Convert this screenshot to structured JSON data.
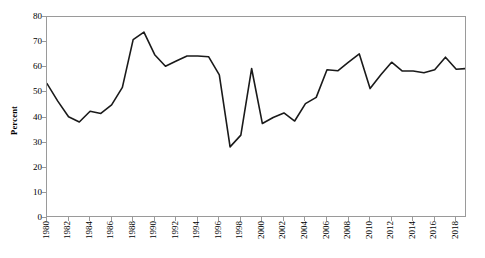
{
  "chart_data": {
    "type": "line",
    "title": "",
    "xlabel": "",
    "ylabel": "Percent",
    "ylim": [
      0,
      80
    ],
    "ytick_step": 10,
    "yticks": [
      0,
      10,
      20,
      30,
      40,
      50,
      60,
      70,
      80
    ],
    "ytick_labels": [
      "0",
      "10",
      "20",
      "30",
      "40",
      "50",
      "60",
      "70",
      "80"
    ],
    "xlim": [
      1980,
      2019
    ],
    "xtick_step": 2,
    "xticks": [
      1980,
      1982,
      1984,
      1986,
      1988,
      1990,
      1992,
      1994,
      1996,
      1998,
      2000,
      2002,
      2004,
      2006,
      2008,
      2010,
      2012,
      2014,
      2016,
      2018
    ],
    "xtick_labels": [
      "1980",
      "1982",
      "1984",
      "1986",
      "1988",
      "1990",
      "1992",
      "1994",
      "1996",
      "1998",
      "2000",
      "2002",
      "2004",
      "2006",
      "2008",
      "2010",
      "2012",
      "2014",
      "2016",
      "2018"
    ],
    "grid": false,
    "legend": false,
    "legend_position": "none",
    "line_color": "#1a1a1a",
    "line_width": 1.6,
    "frame_color": "#9a9a9a",
    "background_color": "#ffffff",
    "x": [
      1980,
      1981,
      1982,
      1983,
      1984,
      1985,
      1986,
      1987,
      1988,
      1989,
      1990,
      1991,
      1992,
      1993,
      1994,
      1995,
      1996,
      1997,
      1998,
      1999,
      2000,
      2001,
      2002,
      2003,
      2004,
      2005,
      2006,
      2007,
      2008,
      2009,
      2010,
      2011,
      2012,
      2013,
      2014,
      2015,
      2016,
      2017,
      2018,
      2019
    ],
    "series": [
      {
        "name": "Percent",
        "values": [
          53.5,
          46.5,
          40.3,
          38.2,
          42.5,
          41.6,
          45.0,
          52.0,
          71.0,
          74.0,
          65.0,
          60.4,
          62.5,
          64.5,
          64.5,
          64.2,
          57.0,
          28.3,
          33.0,
          59.5,
          37.6,
          40.0,
          41.8,
          38.6,
          45.5,
          48.0,
          59.0,
          58.6,
          62.0,
          65.3,
          51.5,
          57.0,
          62.0,
          58.5,
          58.5,
          57.8,
          59.0,
          64.0,
          59.2,
          59.5
        ]
      }
    ]
  }
}
